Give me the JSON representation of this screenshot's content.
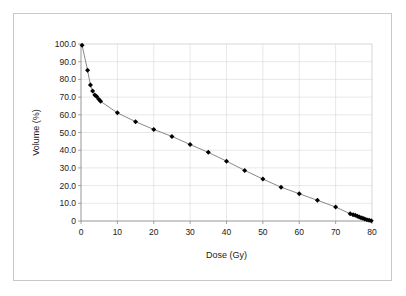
{
  "figure": {
    "border_color": "#c9c9c9",
    "background": "#ffffff"
  },
  "chart_data": {
    "type": "line",
    "title": "",
    "subtitle": "",
    "xlabel": "Dose (Gy)",
    "ylabel": "Volume (%)",
    "xlim": [
      0,
      80
    ],
    "ylim": [
      0,
      100
    ],
    "grid": true,
    "legend": null,
    "legend_position": "none",
    "marker": "diamond",
    "marker_color": "#000000",
    "line_color": "#7a7a7a",
    "xticks": [
      0,
      10,
      20,
      30,
      40,
      50,
      60,
      70,
      80
    ],
    "xtick_labels": [
      "0",
      "10",
      "20",
      "30",
      "40",
      "50",
      "60",
      "70",
      "80"
    ],
    "yticks": [
      0,
      10,
      20,
      30,
      40,
      50,
      60,
      70,
      80,
      90,
      100
    ],
    "ytick_labels": [
      "0",
      "10.0",
      "20.0",
      "30.0",
      "40.0",
      "50.0",
      "60.0",
      "70.0",
      "80.0",
      "90.0",
      "100.0"
    ],
    "series": [
      {
        "name": "DVH",
        "x": [
          0.3,
          1.8,
          2.6,
          3.2,
          3.8,
          4.3,
          4.9,
          5.4,
          10.0,
          15.0,
          20.0,
          25.0,
          30.0,
          35.0,
          40.0,
          45.0,
          50.0,
          55.0,
          60.0,
          65.0,
          70.0,
          74.0,
          74.8,
          75.4,
          76.0,
          76.5,
          77.0,
          77.5,
          78.0,
          78.6,
          79.2,
          79.8
        ],
        "values": [
          99.3,
          85.2,
          76.8,
          73.4,
          71.2,
          70.3,
          68.8,
          67.6,
          61.1,
          56.1,
          51.7,
          47.8,
          43.2,
          38.8,
          33.8,
          28.6,
          23.7,
          19.1,
          15.4,
          11.7,
          7.9,
          4.1,
          3.6,
          3.2,
          2.7,
          2.3,
          1.9,
          1.5,
          1.1,
          0.7,
          0.4,
          0.2
        ]
      }
    ]
  }
}
